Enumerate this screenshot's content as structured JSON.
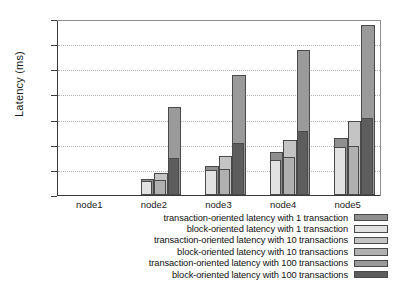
{
  "chart_data": {
    "type": "bar",
    "title": "",
    "xlabel": "",
    "ylabel": "Latency (ms)",
    "ylim": [
      0,
      700
    ],
    "ytick_step": 100,
    "yticks": [
      "700",
      "600",
      "500",
      "400",
      "300",
      "200",
      "100",
      "0"
    ],
    "grid": true,
    "legend_position": "below-axis-right",
    "categories": [
      "node1",
      "node2",
      "node3",
      "node4",
      "node5"
    ],
    "series": [
      {
        "name": "transaction-oriented latency with 1 transaction",
        "color": "#8f8f8f",
        "values": [
          0,
          65,
          115,
          170,
          225
        ]
      },
      {
        "name": "block-oriented latency with 1 transaction",
        "color": "#e2e2e2",
        "values": [
          0,
          55,
          100,
          140,
          190
        ]
      },
      {
        "name": "transaction-oriented latency with 10 transactions",
        "color": "#c4c4c4",
        "values": [
          0,
          88,
          155,
          220,
          295
        ]
      },
      {
        "name": "block-oriented latency with 10 transactions",
        "color": "#b0b0b0",
        "values": [
          0,
          60,
          105,
          152,
          193
        ]
      },
      {
        "name": "transaction-oriented latency with 100 transactions",
        "color": "#9a9a9a",
        "values": [
          0,
          350,
          477,
          578,
          675
        ]
      },
      {
        "name": "block-oriented latency with 100 transactions",
        "color": "#5d5d5d",
        "values": [
          0,
          148,
          205,
          253,
          305
        ]
      }
    ]
  },
  "colors": {
    "axis": "#3a3a3a",
    "grid": "#b4b4b4",
    "text": "#1a1a1a",
    "background": "#ffffff"
  }
}
